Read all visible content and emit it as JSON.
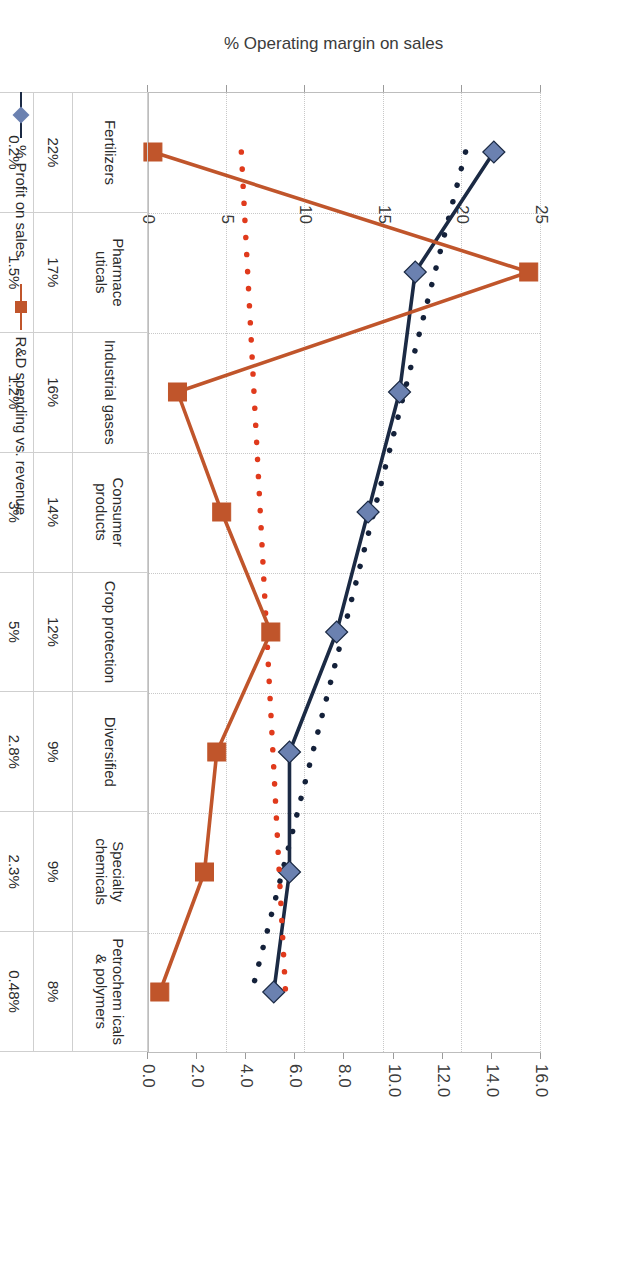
{
  "chart_data": {
    "type": "line",
    "title": "",
    "categories": [
      "Fertilizers",
      "Pharmaceuticals",
      "Industrial gases",
      "Consumer products",
      "Crop protection",
      "Diversified",
      "Specialty chemicals",
      "Petrochemicals & polymers"
    ],
    "category_labels": [
      "Fertilizers",
      "Pharmace uticals",
      "Industrial gases",
      "Consumer products",
      "Crop protection",
      "Diversified",
      "Specialty chemicals",
      "Petrochem icals & polymers"
    ],
    "series": [
      {
        "name": "% Profit on sales",
        "axis": "primary",
        "color": "#1b2a44",
        "marker_color": "#6b81b0",
        "marker": "diamond",
        "values": [
          22,
          17,
          16,
          14,
          12,
          9,
          9,
          8
        ],
        "labels": [
          "22%",
          "17%",
          "16%",
          "14%",
          "12%",
          "9%",
          "9%",
          "8%"
        ],
        "trendline": {
          "style": "dotted",
          "color": "#14213a",
          "start": 20.2,
          "end": 6.6
        }
      },
      {
        "name": "R&D spending vs. revenue",
        "axis": "secondary",
        "color": "#c0552b",
        "marker_color": "#c0552b",
        "marker": "square",
        "values": [
          0.2,
          15.5,
          1.2,
          3.0,
          5.0,
          2.8,
          2.3,
          0.48
        ],
        "labels": [
          "0.2%",
          "1.5%",
          "1.2%",
          "3%",
          "5%",
          "2.8%",
          "2.3%",
          "0.48%"
        ],
        "plotted_values": [
          0.2,
          15.5,
          1.2,
          3.0,
          5.0,
          2.8,
          2.3,
          0.48
        ],
        "trendline": {
          "style": "dotted",
          "color": "#e03a1c",
          "start": 3.8,
          "end": 5.6
        }
      }
    ],
    "primary_axis": {
      "label": "% Operating margin on sales",
      "ticks": [
        0,
        5,
        10,
        15,
        20,
        25
      ],
      "tick_labels": [
        "0",
        "5",
        "10",
        "15",
        "20",
        "25"
      ],
      "min": 0,
      "max": 25
    },
    "secondary_axis": {
      "label": "",
      "ticks": [
        0.0,
        2.0,
        4.0,
        6.0,
        8.0,
        10.0,
        12.0,
        14.0,
        16.0
      ],
      "tick_labels": [
        "0.0",
        "2.0",
        "4.0",
        "6.0",
        "8.0",
        "10.0",
        "12.0",
        "14.0",
        "16.0"
      ],
      "min": 0,
      "max": 16
    },
    "grid": true,
    "legend_position": "bottom-left",
    "table": {
      "row_headers": [
        "",
        "% Profit on sales",
        "R&D spending vs. revenue"
      ],
      "rows": [
        {
          "name": "category-row",
          "cells": [
            "Fertilizers",
            "Pharmace uticals",
            "Industrial gases",
            "Consumer products",
            "Crop protection",
            "Diversified",
            "Specialty chemicals",
            "Petrochem icals & polymers"
          ]
        },
        {
          "name": "profit-row",
          "cells": [
            "22%",
            "17%",
            "16%",
            "14%",
            "12%",
            "9%",
            "9%",
            "8%"
          ]
        },
        {
          "name": "rd-row",
          "cells": [
            "0.2%",
            "1.5%",
            "1.2%",
            "3%",
            "5%",
            "2.8%",
            "2.3%",
            "0.48%"
          ]
        }
      ]
    },
    "legend": [
      {
        "label": "% Profit on sales",
        "color": "#1b2a44",
        "marker_color": "#6b81b0",
        "marker": "diamond"
      },
      {
        "label": "R&D spending vs. revenue",
        "color": "#c0552b",
        "marker_color": "#c0552b",
        "marker": "square"
      }
    ]
  }
}
